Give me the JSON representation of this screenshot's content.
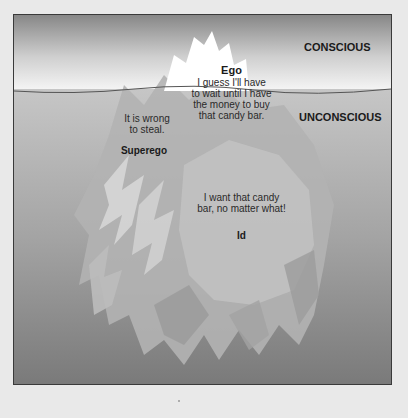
{
  "zones": {
    "conscious_label": "CONSCIOUS",
    "unconscious_label": "UNCONSCIOUS"
  },
  "ego": {
    "title": "Ego",
    "quote_lines": [
      "I guess I'll  have",
      "to wait until I have",
      "the money  to buy",
      "that candy bar."
    ]
  },
  "superego": {
    "title": "Superego",
    "quote_lines": [
      "It is wrong",
      "to steal."
    ]
  },
  "id": {
    "title": "Id",
    "quote_lines": [
      "I want that candy",
      "bar, no matter what!"
    ]
  },
  "colors": {
    "page_bg": "#e9e9e9",
    "sky_top": "#8a8a8a",
    "sky_bottom": "#f4f4f4",
    "water_top": "#c4c4c4",
    "water_bottom": "#7c7c7c",
    "iceberg_tip": "#ffffff",
    "frame_border": "#3a3a3a"
  }
}
